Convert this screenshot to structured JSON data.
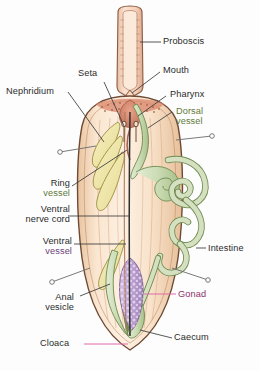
{
  "figure": {
    "organism": "spoon worm",
    "view": "dissected dorsal view"
  },
  "palette": {
    "body_fill": "#f6d9bd",
    "body_fill_light": "#fbe8d4",
    "body_outline": "#6f4a34",
    "proboscis_fill": "#f3cdb3",
    "proboscis_outline": "#8a5a40",
    "nephridium_fill": "#f2eec0",
    "nephridium_outline": "#a3963f",
    "vessel_green_fill": "#cddcb8",
    "vessel_green_outline": "#6d8a4f",
    "intestine_fill": "#cfdcbb",
    "intestine_outline": "#6f8b52",
    "gonad_fill": "#c4a8d6",
    "gonad_outline": "#7a5a93",
    "gonad_dot": "#efe6f5",
    "pharynx_fill": "#d98a72",
    "leader_dark": "#3a3a3a",
    "leader_pink": "#e06aa8",
    "label_dark": "#2b2b2b",
    "label_green": "#5d7a3a",
    "label_purple": "#6d3f7a",
    "label_magenta": "#8e2f6b"
  },
  "labels": [
    {
      "id": "proboscis",
      "text": "Proboscis",
      "text2": "",
      "color": "dark",
      "leader": "dark"
    },
    {
      "id": "mouth",
      "text": "Mouth",
      "text2": "",
      "color": "dark",
      "leader": "dark"
    },
    {
      "id": "pharynx",
      "text": "Pharynx",
      "text2": "",
      "color": "dark",
      "leader": "dark"
    },
    {
      "id": "dorsal-vessel",
      "text": "Dorsal",
      "text2": "vessel",
      "color": "green",
      "leader": "dark"
    },
    {
      "id": "seta",
      "text": "Seta",
      "text2": "",
      "color": "dark",
      "leader": "dark"
    },
    {
      "id": "nephridium",
      "text": "Nephridium",
      "text2": "",
      "color": "dark",
      "leader": "dark"
    },
    {
      "id": "ring-vessel",
      "text": "Ring",
      "text2": "vessel",
      "color": "green",
      "leader": "dark"
    },
    {
      "id": "ventral-nerve-cord",
      "text": "Ventral",
      "text2": "nerve cord",
      "color": "dark",
      "leader": "dark"
    },
    {
      "id": "ventral-vessel",
      "text": "Ventral",
      "text2": "vessel",
      "color": "purple",
      "leader": "dark"
    },
    {
      "id": "intestine",
      "text": "Intestine",
      "text2": "",
      "color": "dark",
      "leader": "dark"
    },
    {
      "id": "anal-vesicle",
      "text": "Anal",
      "text2": "vesicle",
      "color": "dark",
      "leader": "dark"
    },
    {
      "id": "gonad",
      "text": "Gonad",
      "text2": "",
      "color": "magenta",
      "leader": "pink"
    },
    {
      "id": "caecum",
      "text": "Caecum",
      "text2": "",
      "color": "dark",
      "leader": "dark"
    },
    {
      "id": "cloaca",
      "text": "Cloaca",
      "text2": "",
      "color": "dark",
      "leader": "pink"
    }
  ]
}
